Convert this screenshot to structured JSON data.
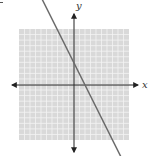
{
  "graph": {
    "type": "coordinate-plane-line",
    "axes": {
      "x_label": "x",
      "y_label": "y"
    },
    "grid": {
      "cells_x": 20,
      "cells_y": 20,
      "x_range": [
        -10,
        10
      ],
      "y_range": [
        -10,
        10
      ]
    },
    "line": {
      "slope": -2,
      "y_intercept": 4,
      "x_intercept": 2,
      "arrows_both_ends": true
    },
    "colors": {
      "grid_bg": "#d9d9d9",
      "grid_lines": "#f4f4f4",
      "axis": "#222222",
      "line": "#6a6a6a"
    }
  }
}
